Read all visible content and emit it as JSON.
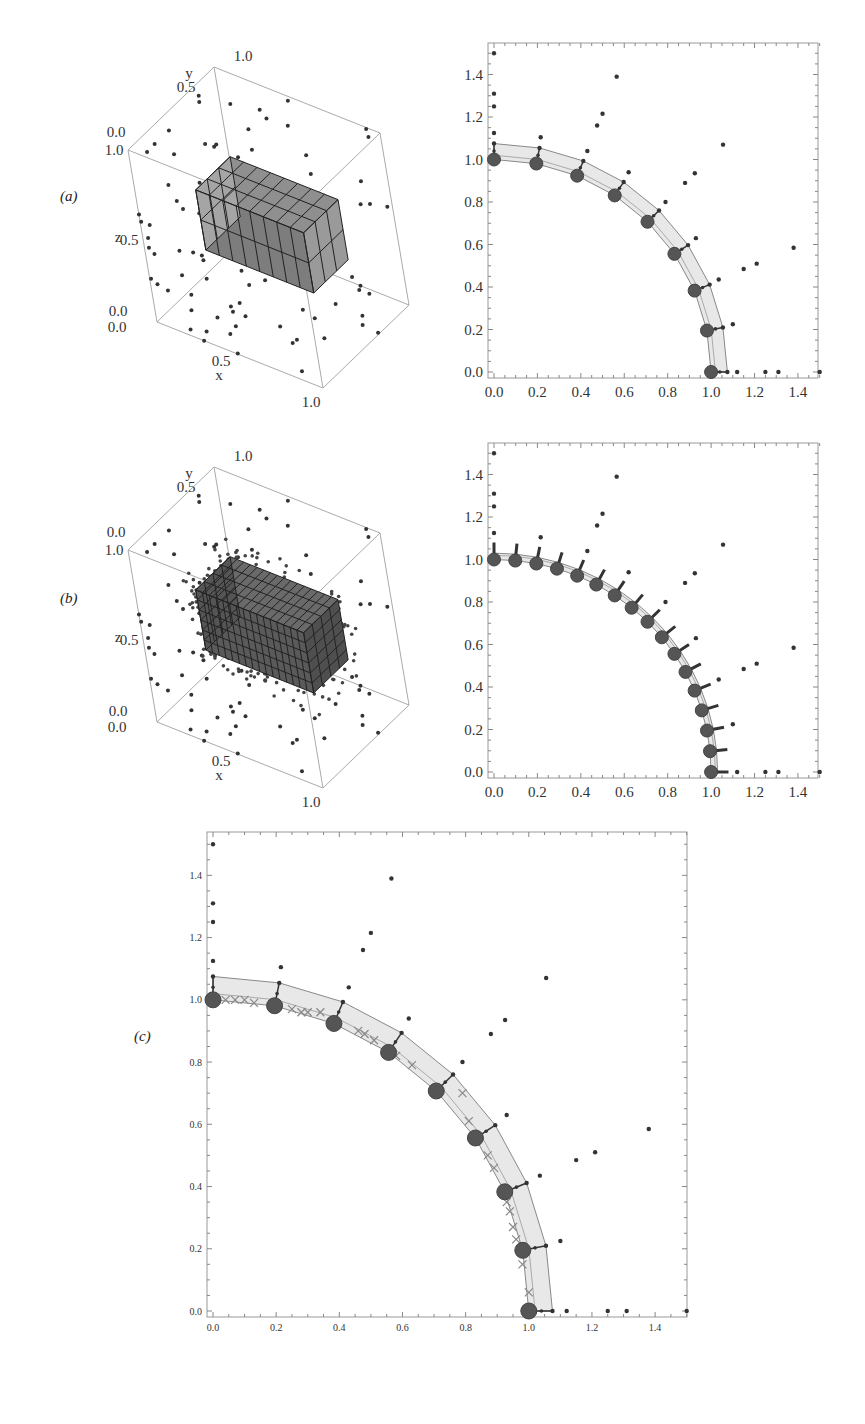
{
  "figure": {
    "panels": [
      {
        "id": "a",
        "label": "(a)"
      },
      {
        "id": "b",
        "label": "(b)"
      },
      {
        "id": "c",
        "label": "(c)"
      }
    ]
  },
  "plot3d": {
    "axis_labels": {
      "x": "x",
      "y": "y",
      "z": "z"
    },
    "ticks": {
      "x": [
        "0.0",
        "0.5",
        "1.0"
      ],
      "y": [
        "0.0",
        "0.5",
        "1.0"
      ],
      "z": [
        "0.0",
        "0.5",
        "1.0"
      ]
    }
  },
  "plot2d": {
    "x_ticks": [
      "0.0",
      "0.2",
      "0.4",
      "0.6",
      "0.8",
      "1.0",
      "1.2",
      "1.4"
    ],
    "y_ticks": [
      "0.0",
      "0.2",
      "0.4",
      "0.6",
      "0.8",
      "1.0",
      "1.2",
      "1.4"
    ]
  },
  "chart_data": [
    {
      "panel": "a-left",
      "type": "scatter",
      "title": "3D mesh of box cells (coarse) with scattered nodes",
      "xlabel": "x",
      "ylabel": "y",
      "zlabel": "z",
      "xlim": [
        0,
        1
      ],
      "ylim": [
        0,
        1
      ],
      "zlim": [
        0,
        1
      ],
      "grid": false,
      "description": "Coarse block of cubic cells (approx 8 x 3 x 2) inside unit cube, surrounded by sparse point cloud"
    },
    {
      "panel": "a-right",
      "type": "scatter",
      "xlim": [
        0,
        1.5
      ],
      "ylim": [
        0,
        1.5
      ],
      "x_ticks": [
        0.0,
        0.2,
        0.4,
        0.6,
        0.8,
        1.0,
        1.2,
        1.4
      ],
      "y_ticks": [
        0.0,
        0.2,
        0.4,
        0.6,
        0.8,
        1.0,
        1.2,
        1.4
      ],
      "series": [
        {
          "name": "boundary nodes (large)",
          "x": [
            0.0,
            0.195,
            0.383,
            0.556,
            0.707,
            0.831,
            0.924,
            0.981,
            1.0
          ],
          "y": [
            1.0,
            0.981,
            0.924,
            0.831,
            0.707,
            0.556,
            0.383,
            0.195,
            0.0
          ]
        },
        {
          "name": "outer band nodes",
          "x": [
            0.0,
            0.21,
            0.41,
            0.6,
            0.76,
            0.89,
            0.99,
            1.06,
            1.08
          ],
          "y": [
            1.08,
            1.06,
            1.0,
            0.9,
            0.77,
            0.6,
            0.42,
            0.22,
            0.0
          ]
        },
        {
          "name": "scattered points",
          "x": [
            0.0,
            0.0,
            0.0,
            0.0,
            0.215,
            0.43,
            0.475,
            0.5,
            0.565,
            0.62,
            0.79,
            0.88,
            0.925,
            0.93,
            1.035,
            1.055,
            1.1,
            1.12,
            1.15,
            1.21,
            1.25,
            1.31,
            1.38,
            1.5
          ],
          "y": [
            1.5,
            1.31,
            1.25,
            1.125,
            1.105,
            1.04,
            1.16,
            1.215,
            1.39,
            0.94,
            0.8,
            0.89,
            0.935,
            0.63,
            0.435,
            1.07,
            0.225,
            0.0,
            0.485,
            0.51,
            0.0,
            0.0,
            0.585,
            0.0
          ]
        }
      ]
    },
    {
      "panel": "b-left",
      "type": "scatter",
      "xlabel": "x",
      "ylabel": "y",
      "zlabel": "z",
      "xlim": [
        0,
        1
      ],
      "ylim": [
        0,
        1
      ],
      "zlim": [
        0,
        1
      ],
      "description": "Refined block of cubic cells inside unit cube, dense point cloud near block surface"
    },
    {
      "panel": "b-right",
      "type": "scatter",
      "xlim": [
        0,
        1.5
      ],
      "ylim": [
        0,
        1.5
      ],
      "x_ticks": [
        0.0,
        0.2,
        0.4,
        0.6,
        0.8,
        1.0,
        1.2,
        1.4
      ],
      "y_ticks": [
        0.0,
        0.2,
        0.4,
        0.6,
        0.8,
        1.0,
        1.2,
        1.4
      ],
      "series": [
        {
          "name": "boundary nodes (large, refined)",
          "x": [
            0.0,
            0.098,
            0.195,
            0.29,
            0.383,
            0.471,
            0.556,
            0.634,
            0.707,
            0.773,
            0.831,
            0.882,
            0.924,
            0.957,
            0.981,
            0.995,
            1.0
          ],
          "y": [
            1.0,
            0.995,
            0.981,
            0.957,
            0.924,
            0.882,
            0.831,
            0.773,
            0.707,
            0.634,
            0.556,
            0.471,
            0.383,
            0.29,
            0.195,
            0.098,
            0.0
          ]
        },
        {
          "name": "scattered points",
          "x": [
            0.0,
            0.0,
            0.0,
            0.0,
            0.215,
            0.43,
            0.475,
            0.5,
            0.565,
            0.62,
            0.79,
            0.88,
            0.925,
            0.93,
            1.035,
            1.055,
            1.1,
            1.12,
            1.15,
            1.21,
            1.25,
            1.31,
            1.38,
            1.5
          ],
          "y": [
            1.5,
            1.31,
            1.25,
            1.125,
            1.105,
            1.04,
            1.16,
            1.215,
            1.39,
            0.94,
            0.8,
            0.89,
            0.935,
            0.63,
            0.435,
            1.07,
            0.225,
            0.0,
            0.485,
            0.51,
            0.0,
            0.0,
            0.585,
            0.0
          ]
        }
      ]
    },
    {
      "panel": "c",
      "type": "scatter",
      "xlim": [
        0,
        1.5
      ],
      "ylim": [
        0,
        1.5
      ],
      "x_ticks": [
        0.0,
        0.2,
        0.4,
        0.6,
        0.8,
        1.0,
        1.2,
        1.4
      ],
      "y_ticks": [
        0.0,
        0.2,
        0.4,
        0.6,
        0.8,
        1.0,
        1.2,
        1.4
      ],
      "series": [
        {
          "name": "boundary nodes (large)",
          "x": [
            0.0,
            0.195,
            0.383,
            0.556,
            0.707,
            0.831,
            0.924,
            0.981,
            1.0
          ],
          "y": [
            1.0,
            0.981,
            0.924,
            0.831,
            0.707,
            0.556,
            0.383,
            0.195,
            0.0
          ]
        },
        {
          "name": "outer band nodes",
          "x": [
            0.0,
            0.21,
            0.41,
            0.6,
            0.76,
            0.89,
            0.99,
            1.06,
            1.08
          ],
          "y": [
            1.08,
            1.06,
            1.0,
            0.9,
            0.77,
            0.6,
            0.42,
            0.22,
            0.0
          ]
        },
        {
          "name": "x markers (interpolated)",
          "x": [
            0.04,
            0.07,
            0.1,
            0.13,
            0.25,
            0.28,
            0.3,
            0.34,
            0.46,
            0.48,
            0.51,
            0.58,
            0.63,
            0.79,
            0.81,
            0.87,
            0.89,
            0.93,
            0.94,
            0.95,
            0.96,
            0.98,
            1.0
          ],
          "y": [
            1.0,
            1.0,
            1.0,
            0.99,
            0.97,
            0.96,
            0.96,
            0.96,
            0.9,
            0.89,
            0.87,
            0.82,
            0.79,
            0.7,
            0.61,
            0.5,
            0.46,
            0.35,
            0.32,
            0.27,
            0.23,
            0.15,
            0.06
          ]
        },
        {
          "name": "scattered points",
          "x": [
            0.0,
            0.0,
            0.0,
            0.0,
            0.215,
            0.43,
            0.475,
            0.5,
            0.565,
            0.62,
            0.79,
            0.88,
            0.925,
            0.93,
            1.035,
            1.055,
            1.1,
            1.12,
            1.15,
            1.21,
            1.25,
            1.31,
            1.38,
            1.5
          ],
          "y": [
            1.5,
            1.31,
            1.25,
            1.125,
            1.105,
            1.04,
            1.16,
            1.215,
            1.39,
            0.94,
            0.8,
            0.89,
            0.935,
            0.63,
            0.435,
            1.07,
            0.225,
            0.0,
            0.485,
            0.51,
            0.0,
            0.0,
            0.585,
            0.0
          ]
        }
      ]
    }
  ]
}
